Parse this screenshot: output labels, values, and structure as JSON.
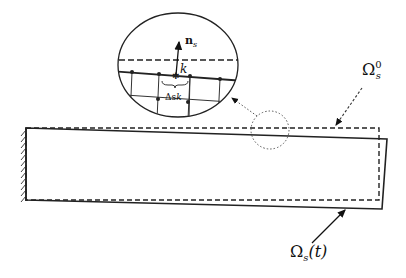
{
  "diagram": {
    "labels": {
      "normal": "n",
      "normal_sub": "s",
      "node": "k",
      "segment": "Δs",
      "segment_sub": "k",
      "reference_domain": "Ω",
      "reference_domain_sub": "s",
      "reference_domain_sup": "0",
      "current_domain": "Ω",
      "current_domain_sub": "s",
      "current_domain_arg": "(t)"
    },
    "elements": {
      "clamped_support": "hatched wall at left end",
      "reference_beam": "dashed rectangle",
      "deformed_beam": "solid quadrilateral",
      "zoom_circle": "dotted circle on top surface",
      "zoom_ellipse": "magnified detail with mesh nodes"
    },
    "colors": {
      "line": "#111111",
      "background": "#ffffff"
    }
  }
}
